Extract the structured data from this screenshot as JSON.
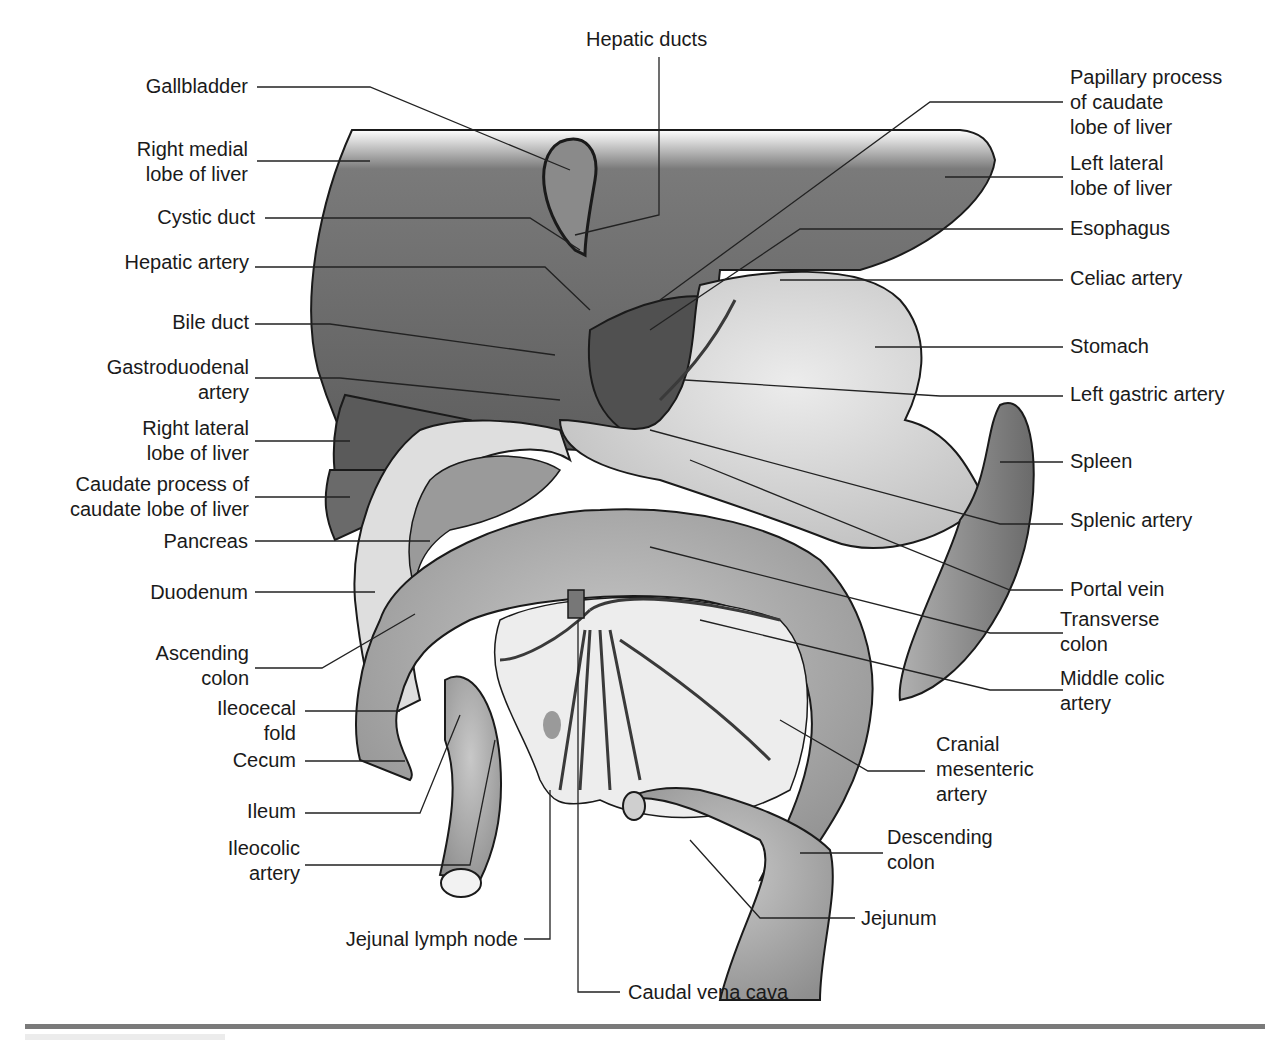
{
  "figure": {
    "colors": {
      "liver": "#6e6e6e",
      "liver_dark": "#4a4a4a",
      "stomach": "#d6d6d6",
      "intestine": "#a8a8a8",
      "spleen": "#8c8c8c",
      "mesentery": "#e8e8e8",
      "leader_line": "#222222",
      "rule": "#7a7a7a"
    }
  },
  "labels": {
    "top": [
      {
        "id": "hepatic-ducts",
        "text": "Hepatic ducts"
      }
    ],
    "left": [
      {
        "id": "gallbladder",
        "lines": [
          "Gallbladder"
        ]
      },
      {
        "id": "right-medial-lobe",
        "lines": [
          "Right medial",
          "lobe of liver"
        ]
      },
      {
        "id": "cystic-duct",
        "lines": [
          "Cystic duct"
        ]
      },
      {
        "id": "hepatic-artery",
        "lines": [
          "Hepatic artery"
        ]
      },
      {
        "id": "bile-duct",
        "lines": [
          "Bile duct"
        ]
      },
      {
        "id": "gastroduodenal-artery",
        "lines": [
          "Gastroduodenal",
          "artery"
        ]
      },
      {
        "id": "right-lateral-lobe",
        "lines": [
          "Right lateral",
          "lobe of liver"
        ]
      },
      {
        "id": "caudate-process",
        "lines": [
          "Caudate process of",
          "caudate lobe of liver"
        ]
      },
      {
        "id": "pancreas",
        "lines": [
          "Pancreas"
        ]
      },
      {
        "id": "duodenum",
        "lines": [
          "Duodenum"
        ]
      },
      {
        "id": "ascending-colon",
        "lines": [
          "Ascending",
          "colon"
        ]
      },
      {
        "id": "ileocecal-fold",
        "lines": [
          "Ileocecal",
          "fold"
        ]
      },
      {
        "id": "cecum",
        "lines": [
          "Cecum"
        ]
      },
      {
        "id": "ileum",
        "lines": [
          "Ileum"
        ]
      },
      {
        "id": "ileocolic-artery",
        "lines": [
          "Ileocolic",
          "artery"
        ]
      }
    ],
    "right": [
      {
        "id": "papillary-process",
        "lines": [
          "Papillary process",
          "of caudate",
          "lobe of liver"
        ]
      },
      {
        "id": "left-lateral-lobe",
        "lines": [
          "Left lateral",
          "lobe of liver"
        ]
      },
      {
        "id": "esophagus",
        "lines": [
          "Esophagus"
        ]
      },
      {
        "id": "celiac-artery",
        "lines": [
          "Celiac artery"
        ]
      },
      {
        "id": "stomach",
        "lines": [
          "Stomach"
        ]
      },
      {
        "id": "left-gastric-artery",
        "lines": [
          "Left gastric artery"
        ]
      },
      {
        "id": "spleen",
        "lines": [
          "Spleen"
        ]
      },
      {
        "id": "splenic-artery",
        "lines": [
          "Splenic artery"
        ]
      },
      {
        "id": "portal-vein",
        "lines": [
          "Portal vein"
        ]
      },
      {
        "id": "transverse-colon",
        "lines": [
          "Transverse",
          "colon"
        ]
      },
      {
        "id": "middle-colic-artery",
        "lines": [
          "Middle colic",
          "artery"
        ]
      },
      {
        "id": "cranial-mesenteric-artery",
        "lines": [
          "Cranial",
          "mesenteric",
          "artery"
        ]
      },
      {
        "id": "descending-colon",
        "lines": [
          "Descending",
          "colon"
        ]
      },
      {
        "id": "jejunum",
        "lines": [
          "Jejunum"
        ]
      }
    ],
    "bottom": [
      {
        "id": "jejunal-lymph-node",
        "text": "Jejunal lymph node"
      },
      {
        "id": "caudal-vena-cava",
        "text": "Caudal vena cava"
      }
    ]
  }
}
